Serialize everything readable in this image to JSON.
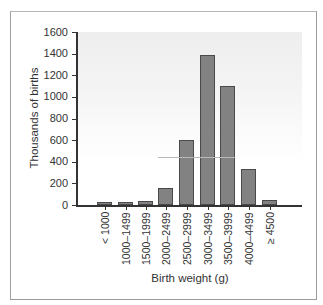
{
  "chart_data": {
    "type": "bar",
    "title": "",
    "xlabel": "Birth weight (g)",
    "ylabel": "Thousands of births",
    "ylim": [
      0,
      1600
    ],
    "yticks": [
      0,
      200,
      400,
      600,
      800,
      1000,
      1200,
      1400,
      1600
    ],
    "categories": [
      "< 1000",
      "1000–1499",
      "1500–1999",
      "2000–2499",
      "2500–2999",
      "3000–3499",
      "3500–3999",
      "4000–4499",
      "≥ 4500"
    ],
    "values": [
      25,
      25,
      40,
      160,
      600,
      1390,
      1100,
      330,
      50
    ],
    "grid": false,
    "legend": null,
    "colors": {
      "bar_fill": "#828282",
      "bar_edge": "#4a4a4a",
      "axis": "#333333",
      "frame": "#9a9a9a"
    }
  },
  "axis": {
    "ytitle": "Thousands of births",
    "xtitle": "Birth weight (g)",
    "yticklabels": [
      "0",
      "200",
      "400",
      "600",
      "800",
      "1000",
      "1200",
      "1400",
      "1600"
    ]
  }
}
